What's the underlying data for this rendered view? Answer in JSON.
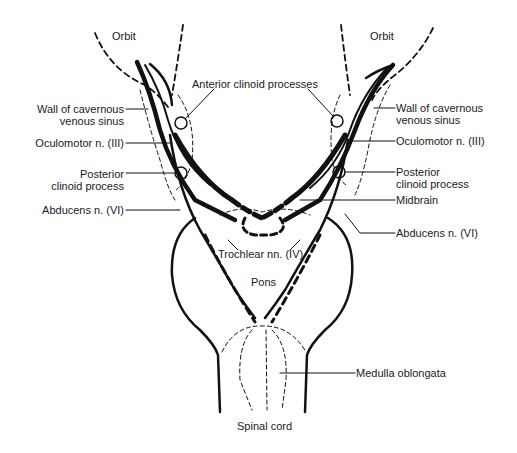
{
  "diagram": {
    "type": "anatomical-diagram",
    "labels": {
      "orbit_left": "Orbit",
      "orbit_right": "Orbit",
      "anterior_clinoid": "Anterior clinoid processes",
      "wall_cavernous_left_1": "Wall of cavernous",
      "wall_cavernous_left_2": "venous sinus",
      "wall_cavernous_right_1": "Wall of cavernous",
      "wall_cavernous_right_2": "venous sinus",
      "oculomotor_left": "Oculomotor n. (III)",
      "oculomotor_right": "Oculomotor n. (III)",
      "posterior_clinoid_left_1": "Posterior",
      "posterior_clinoid_left_2": "clinoid process",
      "posterior_clinoid_right_1": "Posterior",
      "posterior_clinoid_right_2": "clinoid process",
      "abducens_left": "Abducens n. (VI)",
      "abducens_right": "Abducens n. (VI)",
      "midbrain": "Midbrain",
      "trochlear": "Trochlear nn. (IV)",
      "pons": "Pons",
      "medulla": "Medulla oblongata",
      "spinal_cord": "Spinal cord"
    },
    "colors": {
      "ink": "#111111",
      "background": "#ffffff"
    }
  }
}
